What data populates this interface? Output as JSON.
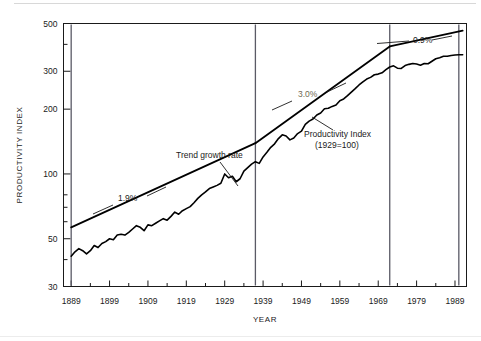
{
  "chart_data": {
    "type": "line",
    "title": "",
    "xlabel": "YEAR",
    "ylabel": "PRODUCTIVITY INDEX",
    "yscale": "log",
    "ylim": [
      30,
      500
    ],
    "xlim": [
      1887,
      1992
    ],
    "grid": false,
    "legend": "none",
    "y_ticks_labeled": [
      500,
      300,
      200,
      100,
      50,
      30
    ],
    "y_ticks_minor": [
      400,
      80,
      70,
      60,
      40
    ],
    "x_ticks": [
      1889,
      1899,
      1909,
      1919,
      1929,
      1939,
      1949,
      1959,
      1969,
      1979,
      1989
    ],
    "x_minor_tick_interval": 5,
    "annotations": [
      {
        "name": "trend-rate-1",
        "text": "1.9%",
        "x": 1916,
        "y": 95
      },
      {
        "name": "trend-rate-2",
        "text": "3.0%",
        "x": 1959,
        "y": 248
      },
      {
        "name": "trend-rate-3",
        "text": "0.9%",
        "x": 1978,
        "y": 430
      },
      {
        "name": "trend-label",
        "text": "Trend growth rate",
        "x": 1925,
        "y": 150
      },
      {
        "name": "series-label-line1",
        "text": "Productivity Index",
        "x": 1955,
        "y": 128
      },
      {
        "name": "series-label-line2",
        "text": "(1929=100)",
        "x": 1955,
        "y": 116
      }
    ],
    "break_years": [
      1889,
      1937,
      1972,
      1990
    ],
    "series": [
      {
        "name": "Productivity Index (1929=100)",
        "color": "#000000",
        "x": [
          1889,
          1890,
          1891,
          1892,
          1893,
          1894,
          1895,
          1896,
          1897,
          1898,
          1899,
          1900,
          1901,
          1902,
          1903,
          1904,
          1905,
          1906,
          1907,
          1908,
          1909,
          1910,
          1911,
          1912,
          1913,
          1914,
          1915,
          1916,
          1917,
          1918,
          1919,
          1920,
          1921,
          1922,
          1923,
          1924,
          1925,
          1926,
          1927,
          1928,
          1929,
          1930,
          1931,
          1932,
          1933,
          1934,
          1935,
          1936,
          1937,
          1938,
          1939,
          1940,
          1941,
          1942,
          1943,
          1944,
          1945,
          1946,
          1947,
          1948,
          1949,
          1950,
          1951,
          1952,
          1953,
          1954,
          1955,
          1956,
          1957,
          1958,
          1959,
          1960,
          1961,
          1962,
          1963,
          1964,
          1965,
          1966,
          1967,
          1968,
          1969,
          1970,
          1971,
          1972,
          1973,
          1974,
          1975,
          1976,
          1977,
          1978,
          1979,
          1980,
          1981,
          1982,
          1983,
          1984,
          1985,
          1986,
          1987,
          1988,
          1989,
          1990,
          1991
        ],
        "y": [
          41.5,
          43.5,
          45.0,
          44.0,
          42.5,
          44.0,
          46.5,
          45.5,
          47.5,
          48.5,
          50.0,
          49.5,
          52.0,
          52.5,
          52.0,
          53.5,
          55.5,
          57.5,
          56.5,
          54.5,
          58.0,
          57.5,
          59.0,
          60.5,
          62.0,
          61.0,
          63.5,
          66.5,
          65.0,
          67.5,
          69.0,
          70.5,
          73.5,
          77.0,
          80.0,
          82.5,
          85.5,
          87.0,
          88.5,
          90.5,
          100.0,
          96.0,
          97.5,
          92.0,
          95.0,
          103.0,
          107.0,
          111.0,
          114.0,
          112.0,
          120.0,
          126.0,
          133.0,
          138.0,
          146.0,
          152.0,
          150.0,
          144.0,
          147.0,
          154.0,
          158.0,
          170.0,
          176.0,
          180.0,
          188.0,
          192.0,
          201.0,
          202.0,
          206.0,
          209.0,
          219.0,
          223.0,
          231.0,
          240.0,
          249.0,
          259.0,
          268.0,
          276.0,
          281.0,
          289.0,
          291.0,
          295.0,
          305.0,
          314.0,
          318.0,
          310.0,
          309.0,
          319.0,
          323.0,
          326.0,
          324.0,
          320.0,
          326.0,
          325.0,
          334.0,
          343.0,
          347.0,
          352.0,
          352.0,
          355.0,
          357.0,
          358.0,
          358.0
        ]
      },
      {
        "name": "Trend growth rate segment 1889-1937 (1.9%)",
        "color": "#000000",
        "rate": "1.9%",
        "x": [
          1889,
          1937
        ],
        "y": [
          56.5,
          139.0
        ]
      },
      {
        "name": "Trend growth rate segment 1937-1972 (3.0%)",
        "color": "#000000",
        "rate": "3.0%",
        "x": [
          1937,
          1972
        ],
        "y": [
          139.0,
          391.0
        ]
      },
      {
        "name": "Trend growth rate segment 1972-1991 (0.9%)",
        "color": "#000000",
        "rate": "0.9%",
        "x": [
          1972,
          1991
        ],
        "y": [
          391.0,
          463.0
        ]
      }
    ]
  },
  "axes": {
    "y_title": "PRODUCTIVITY INDEX",
    "x_title": "YEAR",
    "y_labels": [
      "500",
      "300",
      "200",
      "100",
      "50",
      "30"
    ],
    "x_labels": [
      "1889",
      "1899",
      "1909",
      "1919",
      "1929",
      "1939",
      "1949",
      "1959",
      "1969",
      "1979",
      "1989"
    ]
  },
  "annotations": {
    "rate_1": "1.9%",
    "rate_2": "3.0%",
    "rate_3": "0.9%",
    "trend_label": "Trend growth rate",
    "series_label_1": "Productivity Index",
    "series_label_2": "(1929=100)"
  },
  "colors": {
    "line": "#000000",
    "axis": "#1a1a1a",
    "break_line": "#5a5a66",
    "faded_text": "#6f6a52",
    "background": "#ffffff"
  }
}
